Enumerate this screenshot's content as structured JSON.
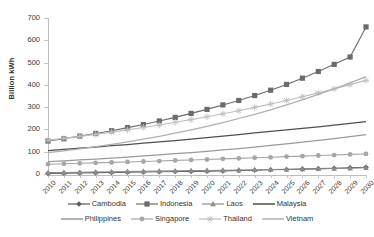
{
  "chart_data": {
    "type": "line",
    "title": "",
    "xlabel": "",
    "ylabel": "Billion kWh",
    "ylim": [
      0,
      700
    ],
    "ytick_values": [
      0,
      100,
      200,
      300,
      400,
      500,
      600,
      700
    ],
    "ytick_labels": [
      "0",
      "100",
      "200",
      "300",
      "400",
      "500",
      "600",
      "700"
    ],
    "grid": false,
    "legend_position": "bottom",
    "categories": [
      "2010",
      "2011",
      "2012",
      "2013",
      "2014",
      "2015",
      "2016",
      "2017",
      "2018",
      "2019",
      "2020",
      "2021",
      "2022",
      "2023",
      "2024",
      "2025",
      "2026",
      "2027",
      "2028",
      "2029",
      "2030"
    ],
    "series": [
      {
        "name": "Cambodia",
        "marker": "diamond",
        "color": "#595959",
        "values": [
          3,
          4,
          5,
          6,
          7,
          8,
          9,
          10,
          11,
          12,
          13,
          14,
          16,
          17,
          19,
          20,
          22,
          24,
          26,
          28,
          30
        ]
      },
      {
        "name": "Indonesia",
        "marker": "square",
        "color": "#6b6b6b",
        "values": [
          148,
          158,
          170,
          182,
          194,
          208,
          222,
          238,
          254,
          272,
          290,
          310,
          330,
          352,
          376,
          402,
          430,
          460,
          492,
          525,
          660
        ]
      },
      {
        "name": "Laos",
        "marker": "triangle",
        "color": "#8c8c8c",
        "values": [
          6,
          7,
          8,
          9,
          10,
          11,
          12,
          13,
          14,
          15,
          16,
          17,
          18,
          19,
          20,
          21,
          22,
          23,
          25,
          26,
          28
        ]
      },
      {
        "name": "Malaysia",
        "marker": "none",
        "color": "#4f4f4f",
        "values": [
          105,
          110,
          116,
          121,
          127,
          132,
          138,
          144,
          150,
          157,
          163,
          170,
          177,
          184,
          191,
          198,
          205,
          212,
          219,
          227,
          235
        ]
      },
      {
        "name": "Philippines",
        "marker": "none",
        "color": "#9a9a9a",
        "values": [
          55,
          59,
          63,
          67,
          71,
          76,
          81,
          86,
          91,
          96,
          102,
          108,
          114,
          121,
          128,
          135,
          143,
          151,
          159,
          168,
          177
        ]
      },
      {
        "name": "Singapore",
        "marker": "circle",
        "color": "#a6a6a6",
        "values": [
          44,
          46,
          48,
          50,
          52,
          54,
          56,
          58,
          61,
          63,
          65,
          68,
          70,
          73,
          75,
          78,
          80,
          83,
          85,
          88,
          90
        ]
      },
      {
        "name": "Thailand",
        "marker": "plus",
        "color": "#bfbfbf",
        "values": [
          152,
          160,
          169,
          178,
          188,
          198,
          209,
          220,
          232,
          244,
          257,
          270,
          284,
          299,
          314,
          330,
          347,
          364,
          382,
          401,
          420
        ]
      },
      {
        "name": "Vietnam",
        "marker": "none",
        "color": "#b0b0b0",
        "values": [
          96,
          104,
          113,
          123,
          133,
          144,
          156,
          169,
          183,
          198,
          214,
          231,
          249,
          268,
          288,
          310,
          333,
          357,
          382,
          409,
          437
        ]
      }
    ]
  }
}
